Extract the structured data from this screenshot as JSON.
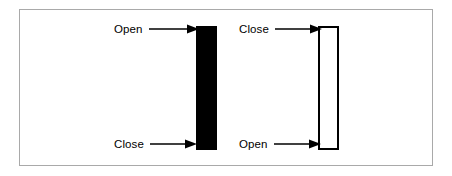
{
  "figure": {
    "type": "candlestick-legend-diagram",
    "background_color": "#ffffff",
    "frame_color": "#a9a9a9",
    "ink_color": "#000000"
  },
  "candles": [
    {
      "id": "filled-candle",
      "style": "filled",
      "fill_color": "#000000",
      "border_color": "#000000",
      "top_label": "Open",
      "bottom_label": "Close"
    },
    {
      "id": "hollow-candle",
      "style": "hollow",
      "fill_color": "#ffffff",
      "border_color": "#000000",
      "top_label": "Close",
      "bottom_label": "Open"
    }
  ],
  "annotations": [
    {
      "id": "left-top",
      "label": "Open",
      "arrow": "arrow-right-icon"
    },
    {
      "id": "left-bottom",
      "label": "Close",
      "arrow": "arrow-right-icon"
    },
    {
      "id": "right-top",
      "label": "Close",
      "arrow": "arrow-right-icon"
    },
    {
      "id": "right-bottom",
      "label": "Open",
      "arrow": "arrow-right-icon"
    }
  ]
}
